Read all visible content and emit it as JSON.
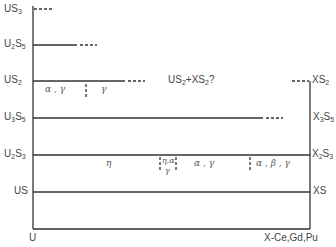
{
  "diagram": {
    "left_axis_label": "U",
    "right_axis_label": "X-Ce,Gd,Pu",
    "left_phases": [
      {
        "base": "US",
        "sub": "3"
      },
      {
        "base": "U",
        "sub": "2",
        "base2": "S",
        "sub2": "5"
      },
      {
        "base": "US",
        "sub": "2"
      },
      {
        "base": "U",
        "sub": "3",
        "base2": "S",
        "sub2": "5"
      },
      {
        "base": "U",
        "sub": "2",
        "base2": "S",
        "sub2": "3"
      },
      {
        "base": "US",
        "sub": ""
      }
    ],
    "right_phases": [
      {
        "base": "XS",
        "sub": "2"
      },
      {
        "base": "X",
        "sub": "3",
        "base2": "S",
        "sub2": "5"
      },
      {
        "base": "X",
        "sub": "2",
        "base2": "S",
        "sub2": "3"
      },
      {
        "base": "XS",
        "sub": ""
      }
    ],
    "annotation": {
      "text1": "US",
      "sub1": "2",
      "text2": "+XS",
      "sub2": "2",
      "text3": "?"
    },
    "region_labels": {
      "us2_left": "α , γ",
      "us2_right": "γ",
      "u2s3_eta": "η",
      "u2s3_mix_top": "η,α",
      "u2s3_mix_bottom": "γ",
      "u2s3_alpha_gamma": "α , γ",
      "u2s3_abg": "α , β , γ"
    }
  }
}
